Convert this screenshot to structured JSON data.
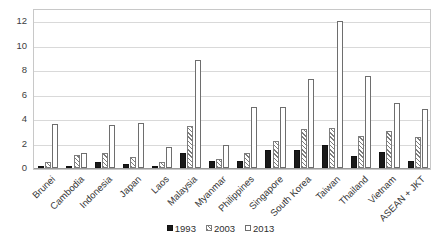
{
  "chart_data": {
    "type": "bar",
    "title": "",
    "subtitle": "",
    "xlabel": "",
    "ylabel": "",
    "ylim": [
      0,
      13
    ],
    "yticks": [
      0,
      2,
      4,
      6,
      8,
      10,
      12
    ],
    "ytick_labels": [
      "0",
      "2",
      "4",
      "6",
      "8",
      "10",
      "12"
    ],
    "grid": true,
    "legend_position": "bottom",
    "categories": [
      "Brunei",
      "Cambodia",
      "Indonesia",
      "Japan",
      "Laos",
      "Malaysia",
      "Myanmar",
      "Philippines",
      "Singapore",
      "South Korea",
      "Taiwan",
      "Thailand",
      "Vietnam",
      "ASEAN + JKT"
    ],
    "series": [
      {
        "name": "1993",
        "color": "#1a1a1a",
        "values": [
          0.15,
          0.2,
          0.5,
          0.35,
          0.2,
          1.2,
          0.55,
          0.55,
          1.5,
          1.5,
          1.9,
          1.0,
          1.3,
          0.6
        ]
      },
      {
        "name": "2003",
        "color": "#7d7d7d",
        "values": [
          0.5,
          1.1,
          1.2,
          0.9,
          0.5,
          3.4,
          0.7,
          1.2,
          2.2,
          3.2,
          3.3,
          2.6,
          3.0,
          2.5
        ]
      },
      {
        "name": "2013",
        "color": "#ffffff",
        "values": [
          3.6,
          1.2,
          3.5,
          3.7,
          1.7,
          8.8,
          1.9,
          5.0,
          5.0,
          7.3,
          12.0,
          7.5,
          5.3,
          4.8
        ]
      }
    ]
  },
  "legend": {
    "items": [
      {
        "label": "1993",
        "swatch": "filled-black-square"
      },
      {
        "label": "2003",
        "swatch": "hatched-square"
      },
      {
        "label": "2013",
        "swatch": "outline-white-square"
      }
    ]
  }
}
